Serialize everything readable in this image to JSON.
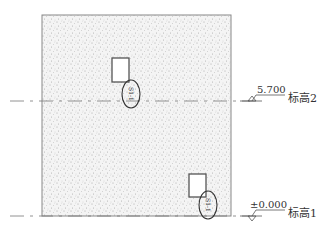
{
  "drawing": {
    "type": "wall elevation",
    "wall": {
      "x": 42,
      "y": 15,
      "width": 189,
      "height": 201,
      "fill": "stippled concrete"
    },
    "levels": [
      {
        "id": "level-2",
        "elevation": "5.700",
        "name": "标高2",
        "y": 101
      },
      {
        "id": "level-1",
        "elevation": "±0.000",
        "name": "标高1",
        "y": 216
      }
    ],
    "openings": [
      {
        "id": "opening-upper",
        "x": 112,
        "y": 58,
        "width": 17,
        "height": 24,
        "tag": "S1-1"
      },
      {
        "id": "opening-lower",
        "x": 189,
        "y": 174,
        "width": 17,
        "height": 23,
        "tag": "S1-1"
      }
    ]
  },
  "colors": {
    "line": "#555555",
    "stipple": "#bdbdbd",
    "text": "#333333"
  }
}
